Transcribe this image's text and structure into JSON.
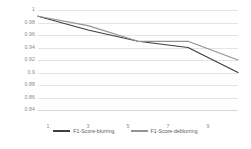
{
  "chart_data": {
    "type": "line",
    "title": "",
    "xlabel": "",
    "ylabel": "",
    "x": [
      1,
      3,
      5,
      7,
      9
    ],
    "categories": [
      "1",
      "3",
      "5",
      "7",
      "9"
    ],
    "xlim": [
      1,
      9
    ],
    "ylim": [
      0.84,
      1
    ],
    "grid": true,
    "legend_position": "bottom",
    "y_ticks": [
      "1",
      "0.98",
      "0.96",
      "0.94",
      "0.92",
      "0.9",
      "0.88",
      "0.86",
      "0.84"
    ],
    "y_tick_values": [
      1,
      0.98,
      0.96,
      0.94,
      0.92,
      0.9,
      0.88,
      0.86,
      0.84
    ],
    "x_ticks": [
      "1",
      "3",
      "5",
      "7",
      "9"
    ],
    "series": [
      {
        "name": "F1-Score-blurring",
        "color": "#3f3f3f",
        "values": [
          0.99,
          0.968,
          0.95,
          0.94,
          0.9
        ]
      },
      {
        "name": "F1-Score-deblurring",
        "color": "#939393",
        "values": [
          0.99,
          0.975,
          0.95,
          0.95,
          0.92
        ]
      }
    ]
  },
  "legend": {
    "items": [
      {
        "label": "F1-Score-blurring",
        "color": "#3f3f3f"
      },
      {
        "label": "F1-Score-deblurring",
        "color": "#939393"
      }
    ]
  }
}
